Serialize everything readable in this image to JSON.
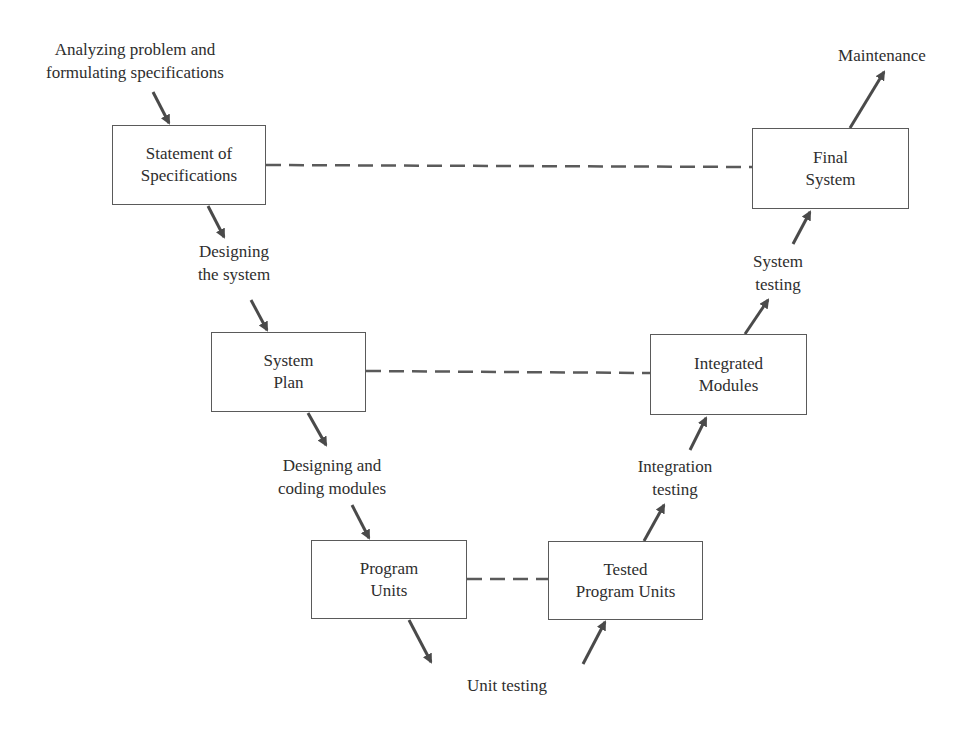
{
  "diagram": {
    "type": "v-model",
    "colors": {
      "arrow": "#4a4a4a",
      "box_border": "#5a5a5a",
      "dash": "#5a5a5a",
      "text": "#2e2e2e"
    },
    "boxes": [
      {
        "id": "spec",
        "lines": [
          "Statement of",
          "Specifications"
        ]
      },
      {
        "id": "plan",
        "lines": [
          "System",
          "Plan"
        ]
      },
      {
        "id": "units",
        "lines": [
          "Program",
          "Units"
        ]
      },
      {
        "id": "tested",
        "lines": [
          "Tested",
          "Program Units"
        ]
      },
      {
        "id": "integrated",
        "lines": [
          "Integrated",
          "Modules"
        ]
      },
      {
        "id": "final",
        "lines": [
          "Final",
          "System"
        ]
      }
    ],
    "activities": [
      {
        "id": "analyzing",
        "lines": [
          "Analyzing problem and",
          "formulating specifications"
        ]
      },
      {
        "id": "designing_system",
        "lines": [
          "Designing",
          "the system"
        ]
      },
      {
        "id": "designing_coding",
        "lines": [
          "Designing and",
          "coding modules"
        ]
      },
      {
        "id": "unit_testing",
        "lines": [
          "Unit testing"
        ]
      },
      {
        "id": "integration_testing",
        "lines": [
          "Integration",
          "testing"
        ]
      },
      {
        "id": "system_testing",
        "lines": [
          "System",
          "testing"
        ]
      },
      {
        "id": "maintenance",
        "lines": [
          "Maintenance"
        ]
      }
    ],
    "correspondences": [
      [
        "Statement of Specifications",
        "Final System"
      ],
      [
        "System Plan",
        "Integrated Modules"
      ],
      [
        "Program Units",
        "Tested Program Units"
      ]
    ]
  }
}
